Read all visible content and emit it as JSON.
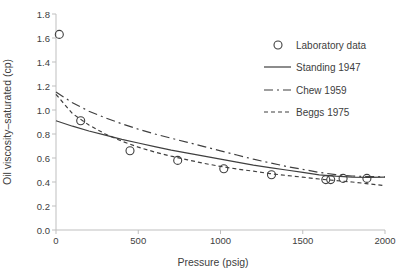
{
  "chart_data": {
    "type": "line",
    "title": "",
    "xlabel": "Pressure (psig)",
    "ylabel": "Oil viscosity–saturated (cp)",
    "xlim": [
      0,
      2000
    ],
    "ylim": [
      0.0,
      1.8
    ],
    "x_ticks": [
      0,
      500,
      1000,
      1500,
      2000
    ],
    "x_tick_labels": [
      "0",
      "500",
      "1000",
      "1500",
      "2000"
    ],
    "y_ticks": [
      0.0,
      0.2,
      0.4,
      0.6,
      0.8,
      1.0,
      1.2,
      1.4,
      1.6,
      1.8
    ],
    "y_tick_labels": [
      "0.0",
      "0.2",
      "0.4",
      "0.6",
      "0.8",
      "1.0",
      "1.2",
      "1.4",
      "1.6",
      "1.8"
    ],
    "grid": false,
    "legend_position": "inside-upper-right",
    "colors": {
      "line": "#3f3f3f",
      "marker": "#3f3f3f",
      "axis": "#bfbfbf",
      "text": "#404040",
      "background": "#ffffff"
    },
    "scatter": {
      "name": "Laboratory data",
      "marker": "open-circle",
      "points": [
        [
          20,
          1.63
        ],
        [
          150,
          0.91
        ],
        [
          450,
          0.66
        ],
        [
          740,
          0.58
        ],
        [
          1020,
          0.51
        ],
        [
          1310,
          0.46
        ],
        [
          1640,
          0.42
        ],
        [
          1670,
          0.42
        ],
        [
          1745,
          0.43
        ],
        [
          1890,
          0.43
        ]
      ]
    },
    "series": [
      {
        "name": "Standing 1947",
        "style": "solid",
        "points": [
          [
            0,
            0.91
          ],
          [
            100,
            0.865
          ],
          [
            200,
            0.825
          ],
          [
            300,
            0.79
          ],
          [
            400,
            0.755
          ],
          [
            500,
            0.725
          ],
          [
            600,
            0.695
          ],
          [
            700,
            0.665
          ],
          [
            800,
            0.64
          ],
          [
            900,
            0.615
          ],
          [
            1000,
            0.59
          ],
          [
            1100,
            0.565
          ],
          [
            1200,
            0.54
          ],
          [
            1300,
            0.52
          ],
          [
            1400,
            0.5
          ],
          [
            1500,
            0.48
          ],
          [
            1600,
            0.46
          ],
          [
            1700,
            0.448
          ],
          [
            1800,
            0.44
          ],
          [
            1900,
            0.438
          ],
          [
            2000,
            0.44
          ]
        ]
      },
      {
        "name": "Chew 1959",
        "style": "dash-dot",
        "points": [
          [
            0,
            1.15
          ],
          [
            100,
            1.06
          ],
          [
            200,
            0.99
          ],
          [
            300,
            0.935
          ],
          [
            400,
            0.885
          ],
          [
            500,
            0.84
          ],
          [
            600,
            0.8
          ],
          [
            700,
            0.765
          ],
          [
            800,
            0.73
          ],
          [
            900,
            0.695
          ],
          [
            1000,
            0.66
          ],
          [
            1100,
            0.625
          ],
          [
            1200,
            0.59
          ],
          [
            1300,
            0.56
          ],
          [
            1400,
            0.53
          ],
          [
            1500,
            0.505
          ],
          [
            1600,
            0.48
          ],
          [
            1700,
            0.462
          ],
          [
            1800,
            0.45
          ],
          [
            1900,
            0.445
          ],
          [
            2000,
            0.443
          ]
        ]
      },
      {
        "name": "Beggs 1975",
        "style": "dashed",
        "points": [
          [
            0,
            1.13
          ],
          [
            100,
            0.97
          ],
          [
            200,
            0.875
          ],
          [
            300,
            0.8
          ],
          [
            400,
            0.74
          ],
          [
            500,
            0.69
          ],
          [
            600,
            0.65
          ],
          [
            700,
            0.615
          ],
          [
            800,
            0.585
          ],
          [
            900,
            0.555
          ],
          [
            1000,
            0.53
          ],
          [
            1100,
            0.508
          ],
          [
            1200,
            0.49
          ],
          [
            1300,
            0.47
          ],
          [
            1400,
            0.455
          ],
          [
            1500,
            0.44
          ],
          [
            1600,
            0.425
          ],
          [
            1700,
            0.412
          ],
          [
            1800,
            0.4
          ],
          [
            1900,
            0.385
          ],
          [
            2000,
            0.37
          ]
        ]
      }
    ],
    "legend_items": [
      {
        "label": "Laboratory data",
        "marker": "open-circle"
      },
      {
        "label": "Standing 1947",
        "marker": "solid-line"
      },
      {
        "label": "Chew 1959",
        "marker": "dash-dot-line"
      },
      {
        "label": "Beggs 1975",
        "marker": "dashed-line"
      }
    ]
  }
}
